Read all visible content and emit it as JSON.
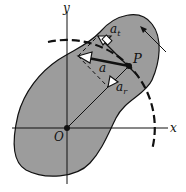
{
  "diagram": {
    "colors": {
      "background": "#ffffff",
      "body_fill": "#9c9c9c",
      "ink": "#111111"
    },
    "labels": {
      "x_axis": "x",
      "y_axis": "y",
      "origin": "O",
      "point": "P",
      "acceleration": "a",
      "tangential_base": "a",
      "tangential_sub": "t",
      "radial_base": "a",
      "radial_sub": "r"
    },
    "geometry": {
      "origin": [
        67,
        128
      ],
      "point_P": [
        129,
        66
      ],
      "circle_radius": 88
    }
  }
}
